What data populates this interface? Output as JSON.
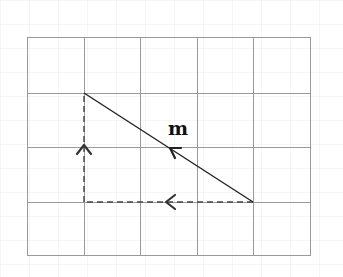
{
  "diagram": {
    "grid": {
      "columns": 5,
      "rows": 4,
      "x_lines": [
        27,
        84,
        140,
        197,
        253,
        310
      ],
      "y_lines": [
        37,
        93,
        147,
        202,
        255
      ],
      "line_color": "#9a9a9a"
    },
    "vector": {
      "label": "m",
      "from": {
        "col": 4,
        "row": 3
      },
      "to": {
        "col": 1,
        "row": 1
      },
      "color": "#222222"
    },
    "components": [
      {
        "name": "horizontal-component",
        "from": {
          "col": 4,
          "row": 3
        },
        "to": {
          "col": 1,
          "row": 3
        },
        "style": "dashed",
        "direction": "left"
      },
      {
        "name": "vertical-component",
        "from": {
          "col": 1,
          "row": 3
        },
        "to": {
          "col": 1,
          "row": 1
        },
        "style": "dashed",
        "direction": "up"
      }
    ]
  }
}
